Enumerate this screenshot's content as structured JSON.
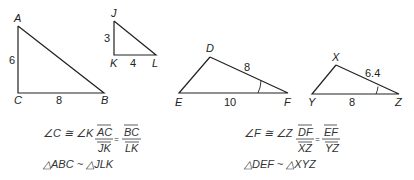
{
  "figure1": {
    "triangle_abc": {
      "vertices": {
        "A": "A",
        "B": "B",
        "C": "C"
      },
      "side_ac": "6",
      "side_cb": "8"
    },
    "triangle_jkl": {
      "vertices": {
        "J": "J",
        "K": "K",
        "L": "L"
      },
      "side_jk": "3",
      "side_kl": "4"
    },
    "statement_angle": "∠C ≅ ∠K",
    "ratio_left_num": "AC",
    "ratio_left_den": "JK",
    "ratio_eq": "=",
    "ratio_right_num": "BC",
    "ratio_right_den": "LK",
    "similarity": "△ABC ~ △JLK"
  },
  "figure2": {
    "triangle_def": {
      "vertices": {
        "D": "D",
        "E": "E",
        "F": "F"
      },
      "side_df": "8",
      "side_ef": "10"
    },
    "triangle_xyz": {
      "vertices": {
        "X": "X",
        "Y": "Y",
        "Z": "Z"
      },
      "side_xz": "6.4",
      "side_yz": "8"
    },
    "statement_angle": "∠F ≅ ∠Z",
    "ratio_left_num": "DF",
    "ratio_left_den": "XZ",
    "ratio_eq": "=",
    "ratio_right_num": "EF",
    "ratio_right_den": "YZ",
    "similarity": "△DEF ~ △XYZ"
  },
  "colors": {
    "stroke": "#222222",
    "text": "#333333"
  }
}
